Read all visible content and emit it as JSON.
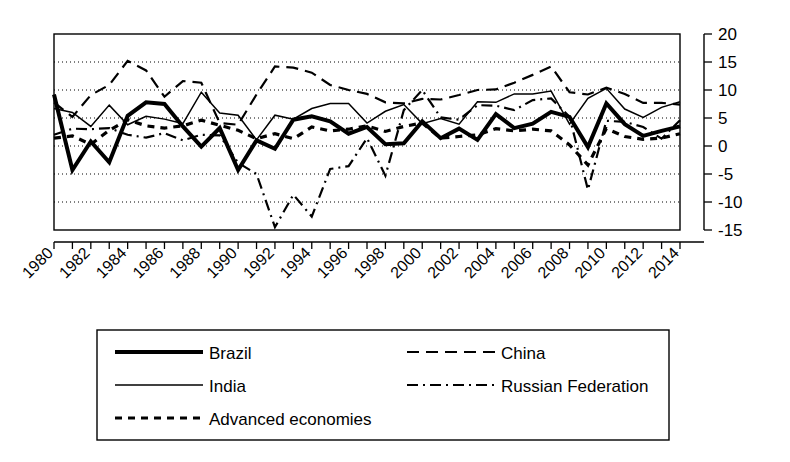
{
  "chart_data": {
    "type": "line",
    "title": "",
    "subtitle": "",
    "xlabel": "",
    "ylabel": "",
    "xlim": [
      1980,
      2014
    ],
    "ylim": [
      -15,
      20
    ],
    "ytick_values": [
      20,
      15,
      10,
      5,
      0,
      -5,
      -10,
      -15
    ],
    "ytick_labels": [
      "20",
      "15",
      "10",
      "5",
      "0",
      "-5",
      "-10",
      "-15"
    ],
    "xtick_labels": [
      "1980",
      "1982",
      "1984",
      "1986",
      "1988",
      "1990",
      "1992",
      "1994",
      "1996",
      "1998",
      "2000",
      "2002",
      "2004",
      "2006",
      "2008",
      "2010",
      "2012",
      "2014"
    ],
    "x": [
      1980,
      1981,
      1982,
      1983,
      1984,
      1985,
      1986,
      1987,
      1988,
      1989,
      1990,
      1991,
      1992,
      1993,
      1994,
      1995,
      1996,
      1997,
      1998,
      1999,
      2000,
      2001,
      2002,
      2003,
      2004,
      2005,
      2006,
      2007,
      2008,
      2009,
      2010,
      2011,
      2012,
      2013,
      2014
    ],
    "grid": true,
    "grid_axis": "y",
    "legend_position": "bottom",
    "series": [
      {
        "name": "Brazil",
        "style": "solid-thick",
        "width": 4.0,
        "dasharray": "",
        "values": [
          9.2,
          -4.3,
          0.8,
          -2.9,
          5.4,
          7.8,
          7.5,
          3.5,
          -0.1,
          3.2,
          -4.3,
          1.0,
          -0.5,
          4.7,
          5.3,
          4.4,
          2.2,
          3.4,
          0.3,
          0.5,
          4.4,
          1.4,
          3.1,
          1.1,
          5.7,
          3.2,
          4.0,
          6.1,
          5.2,
          -0.2,
          7.6,
          3.9,
          1.8,
          2.7,
          3.5
        ]
      },
      {
        "name": "China",
        "style": "dashed",
        "width": 2.2,
        "dasharray": "12 7",
        "values": [
          7.8,
          5.2,
          9.1,
          10.9,
          15.2,
          13.5,
          8.8,
          11.6,
          11.3,
          4.1,
          3.8,
          9.2,
          14.2,
          14.0,
          13.1,
          10.9,
          10.0,
          9.3,
          7.8,
          7.6,
          8.4,
          8.3,
          9.1,
          10.0,
          10.1,
          11.3,
          12.7,
          14.2,
          9.6,
          9.2,
          10.4,
          9.3,
          7.7,
          7.7,
          7.4
        ]
      },
      {
        "name": "India",
        "style": "solid-thin",
        "width": 1.5,
        "dasharray": "",
        "values": [
          6.7,
          6.0,
          3.5,
          7.3,
          3.8,
          5.3,
          4.8,
          4.0,
          9.6,
          5.9,
          5.5,
          1.1,
          5.5,
          4.8,
          6.7,
          7.6,
          7.6,
          4.1,
          6.2,
          7.4,
          4.0,
          4.9,
          3.9,
          7.9,
          7.8,
          9.3,
          9.3,
          9.8,
          3.9,
          8.5,
          10.3,
          6.6,
          5.1,
          6.9,
          7.9
        ]
      },
      {
        "name": "Russian Federation",
        "style": "dash-dot",
        "width": 2.2,
        "dasharray": "11 5 2 5",
        "values": [
          2.0,
          3.1,
          3.0,
          3.2,
          2.0,
          1.5,
          2.3,
          1.0,
          2.0,
          1.9,
          -3.0,
          -5.0,
          -14.5,
          -8.7,
          -12.6,
          -4.1,
          -3.6,
          1.4,
          -5.3,
          6.4,
          10.0,
          5.1,
          4.7,
          7.3,
          7.2,
          6.4,
          8.2,
          8.5,
          5.2,
          -7.8,
          4.5,
          4.3,
          3.4,
          1.3,
          4.6
        ]
      },
      {
        "name": "Advanced economies",
        "style": "dashed-thick",
        "width": 3.2,
        "dasharray": "7 6",
        "values": [
          1.4,
          1.8,
          0.3,
          2.8,
          4.7,
          3.6,
          3.2,
          3.6,
          4.6,
          3.7,
          2.8,
          1.3,
          2.2,
          1.3,
          3.4,
          2.7,
          3.0,
          3.6,
          2.6,
          3.5,
          4.1,
          1.4,
          1.7,
          2.0,
          3.1,
          2.7,
          3.0,
          2.7,
          0.2,
          -3.4,
          3.1,
          1.7,
          1.2,
          1.4,
          2.2
        ]
      }
    ],
    "legend": [
      {
        "label": "Brazil",
        "style": "solid-thick",
        "width": 4.0,
        "dasharray": ""
      },
      {
        "label": "China",
        "style": "dashed",
        "width": 2.2,
        "dasharray": "12 7"
      },
      {
        "label": "India",
        "style": "solid-thin",
        "width": 1.5,
        "dasharray": ""
      },
      {
        "label": "Russian Federation",
        "style": "dash-dot",
        "width": 2.2,
        "dasharray": "11 5 2 5"
      },
      {
        "label": "Advanced economies",
        "style": "dashed-thick",
        "width": 3.2,
        "dasharray": "7 6"
      }
    ],
    "colors": {
      "line": "#000000",
      "background": "#ffffff",
      "grid": "#000000",
      "axis": "#000000"
    }
  }
}
